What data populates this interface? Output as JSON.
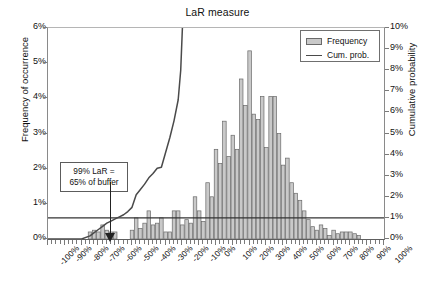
{
  "chart_data": {
    "type": "bar",
    "title": "LaR measure",
    "xlabel": "",
    "ylabel": "Frequency of occurrence",
    "ylabel_right": "Cumulative probability",
    "grid": false,
    "legend_position": "top-right",
    "xlim": [
      -100,
      100
    ],
    "ylim": [
      0,
      6
    ],
    "ylim_right": [
      0,
      10
    ],
    "xtick_labels": [
      "-100%",
      "-90%",
      "-80%",
      "-70%",
      "-60%",
      "-50%",
      "-40%",
      "-30%",
      "-20%",
      "-10%",
      "0%",
      "10%",
      "20%",
      "30%",
      "40%",
      "50%",
      "60%",
      "70%",
      "80%",
      "90%",
      "100%"
    ],
    "ytick_labels_left": [
      "0%",
      "1%",
      "2%",
      "3%",
      "4%",
      "5%",
      "6%"
    ],
    "ytick_labels_right": [
      "0%",
      "1%",
      "2%",
      "3%",
      "4%",
      "5%",
      "6%",
      "7%",
      "8%",
      "9%",
      "10%"
    ],
    "bin_width": 2.5,
    "x": [
      -100,
      -97.5,
      -95,
      -92.5,
      -90,
      -87.5,
      -85,
      -82.5,
      -80,
      -77.5,
      -75,
      -72.5,
      -70,
      -67.5,
      -65,
      -62.5,
      -60,
      -57.5,
      -55,
      -52.5,
      -50,
      -47.5,
      -45,
      -42.5,
      -40,
      -37.5,
      -35,
      -32.5,
      -30,
      -27.5,
      -25,
      -22.5,
      -20,
      -17.5,
      -15,
      -12.5,
      -10,
      -7.5,
      -5,
      -2.5,
      0,
      2.5,
      5,
      7.5,
      10,
      12.5,
      15,
      17.5,
      20,
      22.5,
      25,
      27.5,
      30,
      32.5,
      35,
      37.5,
      40,
      42.5,
      45,
      47.5,
      50,
      52.5,
      55,
      57.5,
      60,
      62.5,
      65,
      67.5,
      70,
      72.5,
      75,
      77.5,
      80,
      82.5,
      85,
      87.5,
      90,
      92.5,
      95,
      97.5,
      100
    ],
    "values": [
      0,
      0,
      0,
      0,
      0,
      0,
      0,
      0,
      0,
      0,
      0.2,
      0.25,
      0.2,
      0.4,
      0.25,
      0.2,
      0.2,
      0,
      0,
      0,
      0.25,
      0.6,
      0.3,
      0.45,
      0.8,
      0.4,
      0.45,
      0.6,
      0.2,
      0.2,
      0.8,
      0.8,
      0.4,
      0.55,
      0.45,
      1.2,
      0.8,
      0.5,
      1.6,
      1.2,
      2.55,
      2.15,
      3.35,
      2.35,
      2.95,
      2.55,
      4.55,
      3.8,
      5.35,
      3.55,
      3.4,
      4.05,
      2.6,
      4.05,
      4.05,
      3.0,
      2.1,
      2.3,
      1.6,
      1.3,
      1.1,
      0.8,
      0.55,
      0.35,
      0.25,
      0.4,
      0.3,
      0.1,
      0.25,
      0.15,
      0.2,
      0.2,
      0.2,
      0.15,
      0.1,
      0,
      0,
      0,
      0,
      0,
      0
    ],
    "series": [
      {
        "name": "Frequency",
        "type": "bar",
        "axis": "left",
        "color": "#c9c9c9",
        "edge_color": "#6a6a6a"
      },
      {
        "name": "Cum. prob.",
        "type": "line",
        "axis": "right",
        "color": "#4a4a4a",
        "x": [
          -100,
          -80,
          -75,
          -72.5,
          -70,
          -67.5,
          -65,
          -62.5,
          -60,
          -57.5,
          -55,
          -52.5,
          -50,
          -47.5,
          -45,
          -42.5,
          -40,
          -37.5,
          -35,
          -32.5,
          -30,
          -27.5,
          -25,
          -22.5,
          -21,
          -20
        ],
        "values": [
          0,
          0,
          0.15,
          0.3,
          0.45,
          0.6,
          0.75,
          0.85,
          0.95,
          1.05,
          1.15,
          1.3,
          1.5,
          2.1,
          2.35,
          2.6,
          2.9,
          3.1,
          3.35,
          3.4,
          4.1,
          4.8,
          5.6,
          6.6,
          8.0,
          10.0
        ]
      }
    ],
    "reference_line": {
      "name": "99% cumulative probability level",
      "axis": "right",
      "value": 1.0,
      "color": "#333333"
    },
    "annotation": {
      "line1": "99% LaR =",
      "line2": "65% of buffer",
      "points_to_x": "-60%"
    }
  },
  "legend": {
    "items": [
      {
        "label": "Frequency",
        "marker": "bar-swatch"
      },
      {
        "label": "Cum. prob.",
        "marker": "line-swatch"
      }
    ]
  }
}
